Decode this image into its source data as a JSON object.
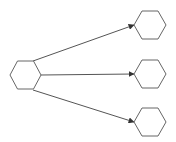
{
  "diagram": {
    "type": "fan-out graph",
    "stroke_color": "#555555",
    "fill_color": "#ffffff",
    "nodes": [
      {
        "id": "source",
        "shape": "hexagon",
        "cx": 25.5,
        "cy": 75
      },
      {
        "id": "target-top",
        "shape": "hexagon",
        "cx": 150,
        "cy": 25
      },
      {
        "id": "target-middle",
        "shape": "hexagon",
        "cx": 150,
        "cy": 74
      },
      {
        "id": "target-bottom",
        "shape": "hexagon",
        "cx": 150,
        "cy": 122
      }
    ],
    "edges": [
      {
        "from": "source",
        "to": "target-top",
        "arrow": true
      },
      {
        "from": "source",
        "to": "target-middle",
        "arrow": true
      },
      {
        "from": "source",
        "to": "target-bottom",
        "arrow": true
      }
    ]
  }
}
